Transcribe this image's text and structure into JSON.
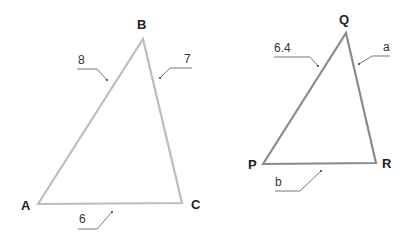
{
  "diagram": {
    "triangles": [
      {
        "name": "ABC",
        "vertices": {
          "A": "A",
          "B": "B",
          "C": "C"
        },
        "sides": {
          "AB": "8",
          "BC": "7",
          "AC": "6"
        },
        "stroke_color": "#bdbdbd"
      },
      {
        "name": "PQR",
        "vertices": {
          "P": "P",
          "Q": "Q",
          "R": "R"
        },
        "sides": {
          "PQ": "6.4",
          "QR": "a",
          "PR": "b"
        },
        "stroke_color": "#8a8a8a"
      }
    ]
  }
}
